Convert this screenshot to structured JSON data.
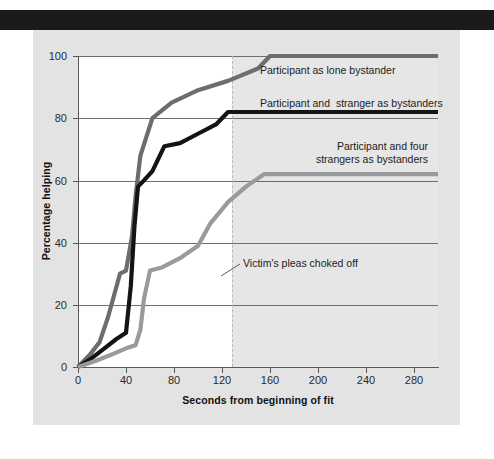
{
  "figure": {
    "background_color": "#e3e3e3",
    "top_band_color": "#1a1a1a",
    "plot_background_color": "#ffffff",
    "plot_shaded_color": "#e6e6e6"
  },
  "chart_data": {
    "type": "line",
    "title": "",
    "subtitle": "",
    "xlabel": "Seconds from beginning of fit",
    "ylabel": "Percentage helping",
    "xlim": [
      0,
      300
    ],
    "ylim": [
      0,
      100
    ],
    "xticks": [
      0,
      40,
      80,
      120,
      160,
      200,
      240,
      280
    ],
    "xtick_labels": [
      "0",
      "40",
      "80",
      "120",
      "160",
      "200",
      "240",
      "280"
    ],
    "yticks": [
      0,
      20,
      40,
      60,
      80,
      100
    ],
    "ytick_labels": [
      "0",
      "20",
      "40",
      "60",
      "80",
      "100"
    ],
    "grid": "horizontal",
    "legend_position": "inline-annotations",
    "series": [
      {
        "name": "Participant as lone bystander",
        "color": "#6d6d70",
        "line_width": 4.2,
        "plateau_value": 100,
        "label_x": 160,
        "label_y": 95,
        "x": [
          0,
          10,
          18,
          25,
          35,
          40,
          45,
          48,
          52,
          62,
          78,
          100,
          125,
          150,
          160,
          300
        ],
        "y": [
          0,
          4,
          8,
          16,
          30,
          31,
          42,
          55,
          68,
          80,
          85,
          89,
          92,
          96,
          100,
          100
        ]
      },
      {
        "name": "Participant and  stranger as bystanders",
        "color": "#141414",
        "line_width": 4.2,
        "plateau_value": 82,
        "label_x": 160,
        "label_y": 87,
        "x": [
          0,
          12,
          22,
          32,
          40,
          44,
          47,
          50,
          55,
          62,
          72,
          85,
          100,
          115,
          125,
          300
        ],
        "y": [
          0,
          3,
          6,
          9,
          11,
          26,
          45,
          58,
          60,
          63,
          71,
          72,
          75,
          78,
          82,
          82
        ]
      },
      {
        "name": "Participant and four\nstrangers as bystanders",
        "color": "#9a9a9c",
        "line_width": 4.2,
        "plateau_value": 62,
        "label_x": 200,
        "label_y": 70,
        "x": [
          0,
          15,
          28,
          40,
          48,
          52,
          55,
          60,
          70,
          85,
          100,
          110,
          125,
          140,
          155,
          300
        ],
        "y": [
          0,
          2,
          4,
          6,
          7,
          12,
          22,
          31,
          32,
          35,
          39,
          46,
          53,
          58,
          62,
          62
        ]
      }
    ],
    "annotations": [
      {
        "text": "Victim's pleas choked off",
        "x": 125,
        "y": 30,
        "marker": "dashed-vertical-line",
        "marker_color": "#b9b9bb",
        "leader_line": true
      }
    ]
  },
  "axes": {
    "y_title": "Percentage helping",
    "x_title": "Seconds from beginning of fit",
    "y_labels": [
      "100",
      "80",
      "60",
      "40",
      "20",
      "0"
    ],
    "x_labels": [
      "0",
      "40",
      "80",
      "120",
      "160",
      "200",
      "240",
      "280"
    ]
  },
  "labels": {
    "series_1": "Participant as lone bystander",
    "series_2": "Participant and  stranger as bystanders",
    "series_3_line1": "Participant and four",
    "series_3_line2": "strangers as bystanders",
    "annotation_1": "Victim's pleas choked off"
  }
}
